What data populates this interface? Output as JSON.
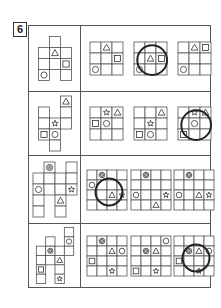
{
  "question": {
    "number": "6"
  },
  "rows": [
    {
      "net": {
        "cells": [
          [
            1,
            0
          ],
          [
            0,
            1
          ],
          [
            1,
            1
          ],
          [
            2,
            1
          ],
          [
            0,
            2
          ],
          [
            1,
            2
          ],
          [
            2,
            2
          ],
          [
            0,
            3
          ],
          [
            2,
            3
          ]
        ],
        "shapes": [
          {
            "type": "triangle",
            "c": 1,
            "r": 1
          },
          {
            "type": "square",
            "c": 2,
            "r": 2
          },
          {
            "type": "circle",
            "c": 0,
            "r": 3
          }
        ]
      },
      "options": [
        {
          "cols": 3,
          "rows": 3,
          "shapes": [
            {
              "type": "triangle",
              "c": 1,
              "r": 0
            },
            {
              "type": "square",
              "c": 2,
              "r": 1
            },
            {
              "type": "circle",
              "c": 0,
              "r": 2
            }
          ],
          "marked": false
        },
        {
          "cols": 3,
          "rows": 3,
          "shapes": [
            {
              "type": "triangle",
              "c": 1,
              "r": 1
            },
            {
              "type": "square",
              "c": 2,
              "r": 1
            },
            {
              "type": "circle",
              "c": 0,
              "r": 2
            }
          ],
          "marked": true
        },
        {
          "cols": 3,
          "rows": 3,
          "shapes": [
            {
              "type": "triangle",
              "c": 1,
              "r": 0
            },
            {
              "type": "square",
              "c": 2,
              "r": 0
            },
            {
              "type": "circle",
              "c": 0,
              "r": 2
            }
          ],
          "marked": false
        }
      ]
    },
    {
      "net": {
        "cells": [
          [
            2,
            0
          ],
          [
            0,
            1
          ],
          [
            2,
            1
          ],
          [
            0,
            2
          ],
          [
            1,
            2
          ],
          [
            2,
            2
          ],
          [
            0,
            3
          ],
          [
            1,
            3
          ],
          [
            1,
            4
          ]
        ],
        "shapes": [
          {
            "type": "triangle",
            "c": 2,
            "r": 0
          },
          {
            "type": "star",
            "c": 1,
            "r": 2
          },
          {
            "type": "square",
            "c": 0,
            "r": 3
          },
          {
            "type": "circle",
            "c": 1,
            "r": 3
          }
        ]
      },
      "options": [
        {
          "cols": 3,
          "rows": 3,
          "shapes": [
            {
              "type": "star",
              "c": 1,
              "r": 0
            },
            {
              "type": "triangle",
              "c": 2,
              "r": 0
            },
            {
              "type": "square",
              "c": 0,
              "r": 1
            },
            {
              "type": "circle",
              "c": 1,
              "r": 1
            }
          ],
          "marked": false
        },
        {
          "cols": 3,
          "rows": 3,
          "shapes": [
            {
              "type": "triangle",
              "c": 2,
              "r": 0
            },
            {
              "type": "star",
              "c": 1,
              "r": 1
            },
            {
              "type": "square",
              "c": 0,
              "r": 2
            },
            {
              "type": "circle",
              "c": 1,
              "r": 2
            }
          ],
          "marked": false
        },
        {
          "cols": 3,
          "rows": 3,
          "shapes": [
            {
              "type": "star",
              "c": 1,
              "r": 0
            },
            {
              "type": "triangle",
              "c": 2,
              "r": 0
            },
            {
              "type": "circle",
              "c": 1,
              "r": 1
            },
            {
              "type": "square",
              "c": 0,
              "r": 2
            }
          ],
          "marked": true
        }
      ]
    },
    {
      "net": {
        "cells": [
          [
            1,
            0
          ],
          [
            3,
            0
          ],
          [
            0,
            1
          ],
          [
            1,
            1
          ],
          [
            2,
            1
          ],
          [
            3,
            1
          ],
          [
            0,
            2
          ],
          [
            1,
            2
          ],
          [
            2,
            2
          ],
          [
            3,
            2
          ],
          [
            0,
            3
          ],
          [
            2,
            3
          ],
          [
            0,
            4
          ],
          [
            2,
            4
          ]
        ],
        "shapes": [
          {
            "type": "target",
            "c": 1,
            "r": 0
          },
          {
            "type": "circle",
            "c": 0,
            "r": 2
          },
          {
            "type": "star",
            "c": 3,
            "r": 2
          },
          {
            "type": "triangle",
            "c": 2,
            "r": 3
          }
        ]
      },
      "options": [
        {
          "cols": 4,
          "rows": 4,
          "shapes": [
            {
              "type": "target",
              "c": 1,
              "r": 0
            },
            {
              "type": "circle",
              "c": 0,
              "r": 1
            },
            {
              "type": "triangle",
              "c": 2,
              "r": 2
            },
            {
              "type": "star",
              "c": 3,
              "r": 2
            }
          ],
          "marked": true
        },
        {
          "cols": 4,
          "rows": 4,
          "shapes": [
            {
              "type": "target",
              "c": 1,
              "r": 0
            },
            {
              "type": "circle",
              "c": 0,
              "r": 2
            },
            {
              "type": "star",
              "c": 3,
              "r": 2
            },
            {
              "type": "triangle",
              "c": 2,
              "r": 3
            }
          ],
          "marked": false
        },
        {
          "cols": 4,
          "rows": 4,
          "shapes": [
            {
              "type": "target",
              "c": 1,
              "r": 0
            },
            {
              "type": "circle",
              "c": 0,
              "r": 2
            },
            {
              "type": "triangle",
              "c": 2,
              "r": 2
            },
            {
              "type": "star",
              "c": 3,
              "r": 2
            }
          ],
          "marked": false
        }
      ]
    },
    {
      "net": {
        "cells": [
          [
            3,
            0
          ],
          [
            1,
            1
          ],
          [
            3,
            1
          ],
          [
            0,
            2
          ],
          [
            1,
            2
          ],
          [
            2,
            2
          ],
          [
            3,
            2
          ],
          [
            0,
            3
          ],
          [
            1,
            3
          ],
          [
            2,
            3
          ],
          [
            0,
            4
          ],
          [
            2,
            4
          ],
          [
            0,
            5
          ],
          [
            2,
            5
          ]
        ],
        "shapes": [
          {
            "type": "circle",
            "c": 3,
            "r": 1
          },
          {
            "type": "target",
            "c": 1,
            "r": 2
          },
          {
            "type": "triangle",
            "c": 2,
            "r": 3
          },
          {
            "type": "square",
            "c": 0,
            "r": 4
          },
          {
            "type": "star",
            "c": 2,
            "r": 5
          }
        ]
      },
      "options": [
        {
          "cols": 4,
          "rows": 4,
          "shapes": [
            {
              "type": "target",
              "c": 1,
              "r": 0
            },
            {
              "type": "triangle",
              "c": 2,
              "r": 1
            },
            {
              "type": "circle",
              "c": 3,
              "r": 1
            },
            {
              "type": "square",
              "c": 0,
              "r": 2
            },
            {
              "type": "star",
              "c": 2,
              "r": 3
            }
          ],
          "marked": false
        },
        {
          "cols": 4,
          "rows": 4,
          "shapes": [
            {
              "type": "circle",
              "c": 3,
              "r": 0
            },
            {
              "type": "target",
              "c": 1,
              "r": 1
            },
            {
              "type": "triangle",
              "c": 2,
              "r": 1
            },
            {
              "type": "square",
              "c": 0,
              "r": 3
            },
            {
              "type": "star",
              "c": 2,
              "r": 3
            }
          ],
          "marked": false
        },
        {
          "cols": 4,
          "rows": 4,
          "shapes": [
            {
              "type": "target",
              "c": 1,
              "r": 1
            },
            {
              "type": "triangle",
              "c": 2,
              "r": 1
            },
            {
              "type": "circle",
              "c": 3,
              "r": 1
            },
            {
              "type": "square",
              "c": 0,
              "r": 2
            },
            {
              "type": "star",
              "c": 2,
              "r": 3
            }
          ],
          "marked": true
        }
      ]
    }
  ]
}
